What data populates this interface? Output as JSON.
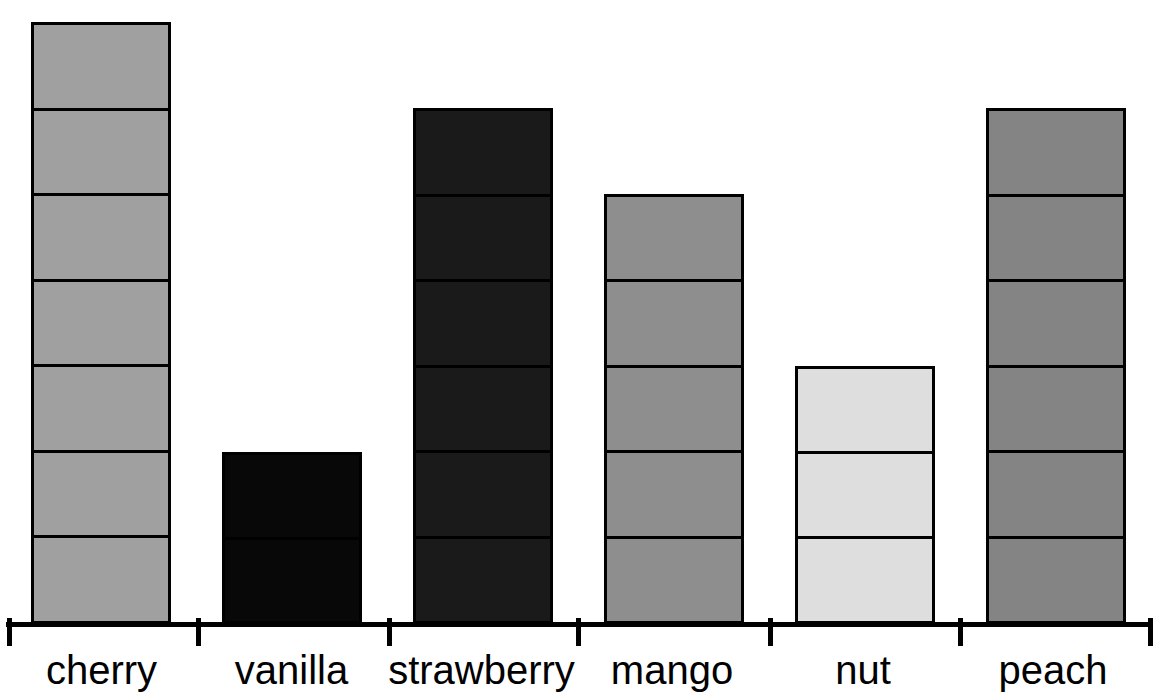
{
  "chart_data": {
    "type": "bar",
    "title": "",
    "subtitle": "",
    "xlabel": "",
    "ylabel": "",
    "categories": [
      "cherry",
      "vanilla",
      "strawberry",
      "mango",
      "nut",
      "peach"
    ],
    "values": [
      7,
      2,
      6,
      5,
      3,
      6
    ],
    "unit": "segments",
    "ylim": [
      0,
      7
    ],
    "grid": false,
    "legend": false,
    "stacked_segments": true,
    "annotations": [],
    "tick_labels_x": [
      "cherry",
      "vanilla",
      "strawberry",
      "mango",
      "nut",
      "peach"
    ],
    "tick_labels_y": [],
    "series": [
      {
        "name": "count",
        "values": [
          7,
          2,
          6,
          5,
          3,
          6
        ]
      }
    ],
    "bars": [
      {
        "category": "cherry",
        "value": 7,
        "segments": 7,
        "fill": "#a0a0a0",
        "stroke": "#000000",
        "left": 31,
        "width": 140,
        "top": 20
      },
      {
        "category": "vanilla",
        "value": 2,
        "segments": 2,
        "fill": "#080808",
        "stroke": "#000000",
        "left": 222,
        "width": 140,
        "top": 450
      },
      {
        "category": "strawberry",
        "value": 6,
        "segments": 6,
        "fill": "#1a1a1a",
        "stroke": "#000000",
        "left": 413,
        "width": 140,
        "top": 106
      },
      {
        "category": "mango",
        "value": 5,
        "segments": 5,
        "fill": "#8e8e8e",
        "stroke": "#000000",
        "left": 604,
        "width": 140,
        "top": 192
      },
      {
        "category": "nut",
        "value": 3,
        "segments": 3,
        "fill": "#dedede",
        "stroke": "#000000",
        "left": 795,
        "width": 140,
        "top": 364
      },
      {
        "category": "peach",
        "value": 6,
        "segments": 6,
        "fill": "#848484",
        "stroke": "#000000",
        "left": 986,
        "width": 140,
        "top": 106
      }
    ],
    "axis": {
      "line_color": "#000000",
      "tick_positions": [
        7,
        196,
        387,
        576,
        768,
        958,
        1148
      ]
    },
    "colors": {
      "background": "#ffffff",
      "outline": "#000000",
      "text": "#000000"
    }
  }
}
